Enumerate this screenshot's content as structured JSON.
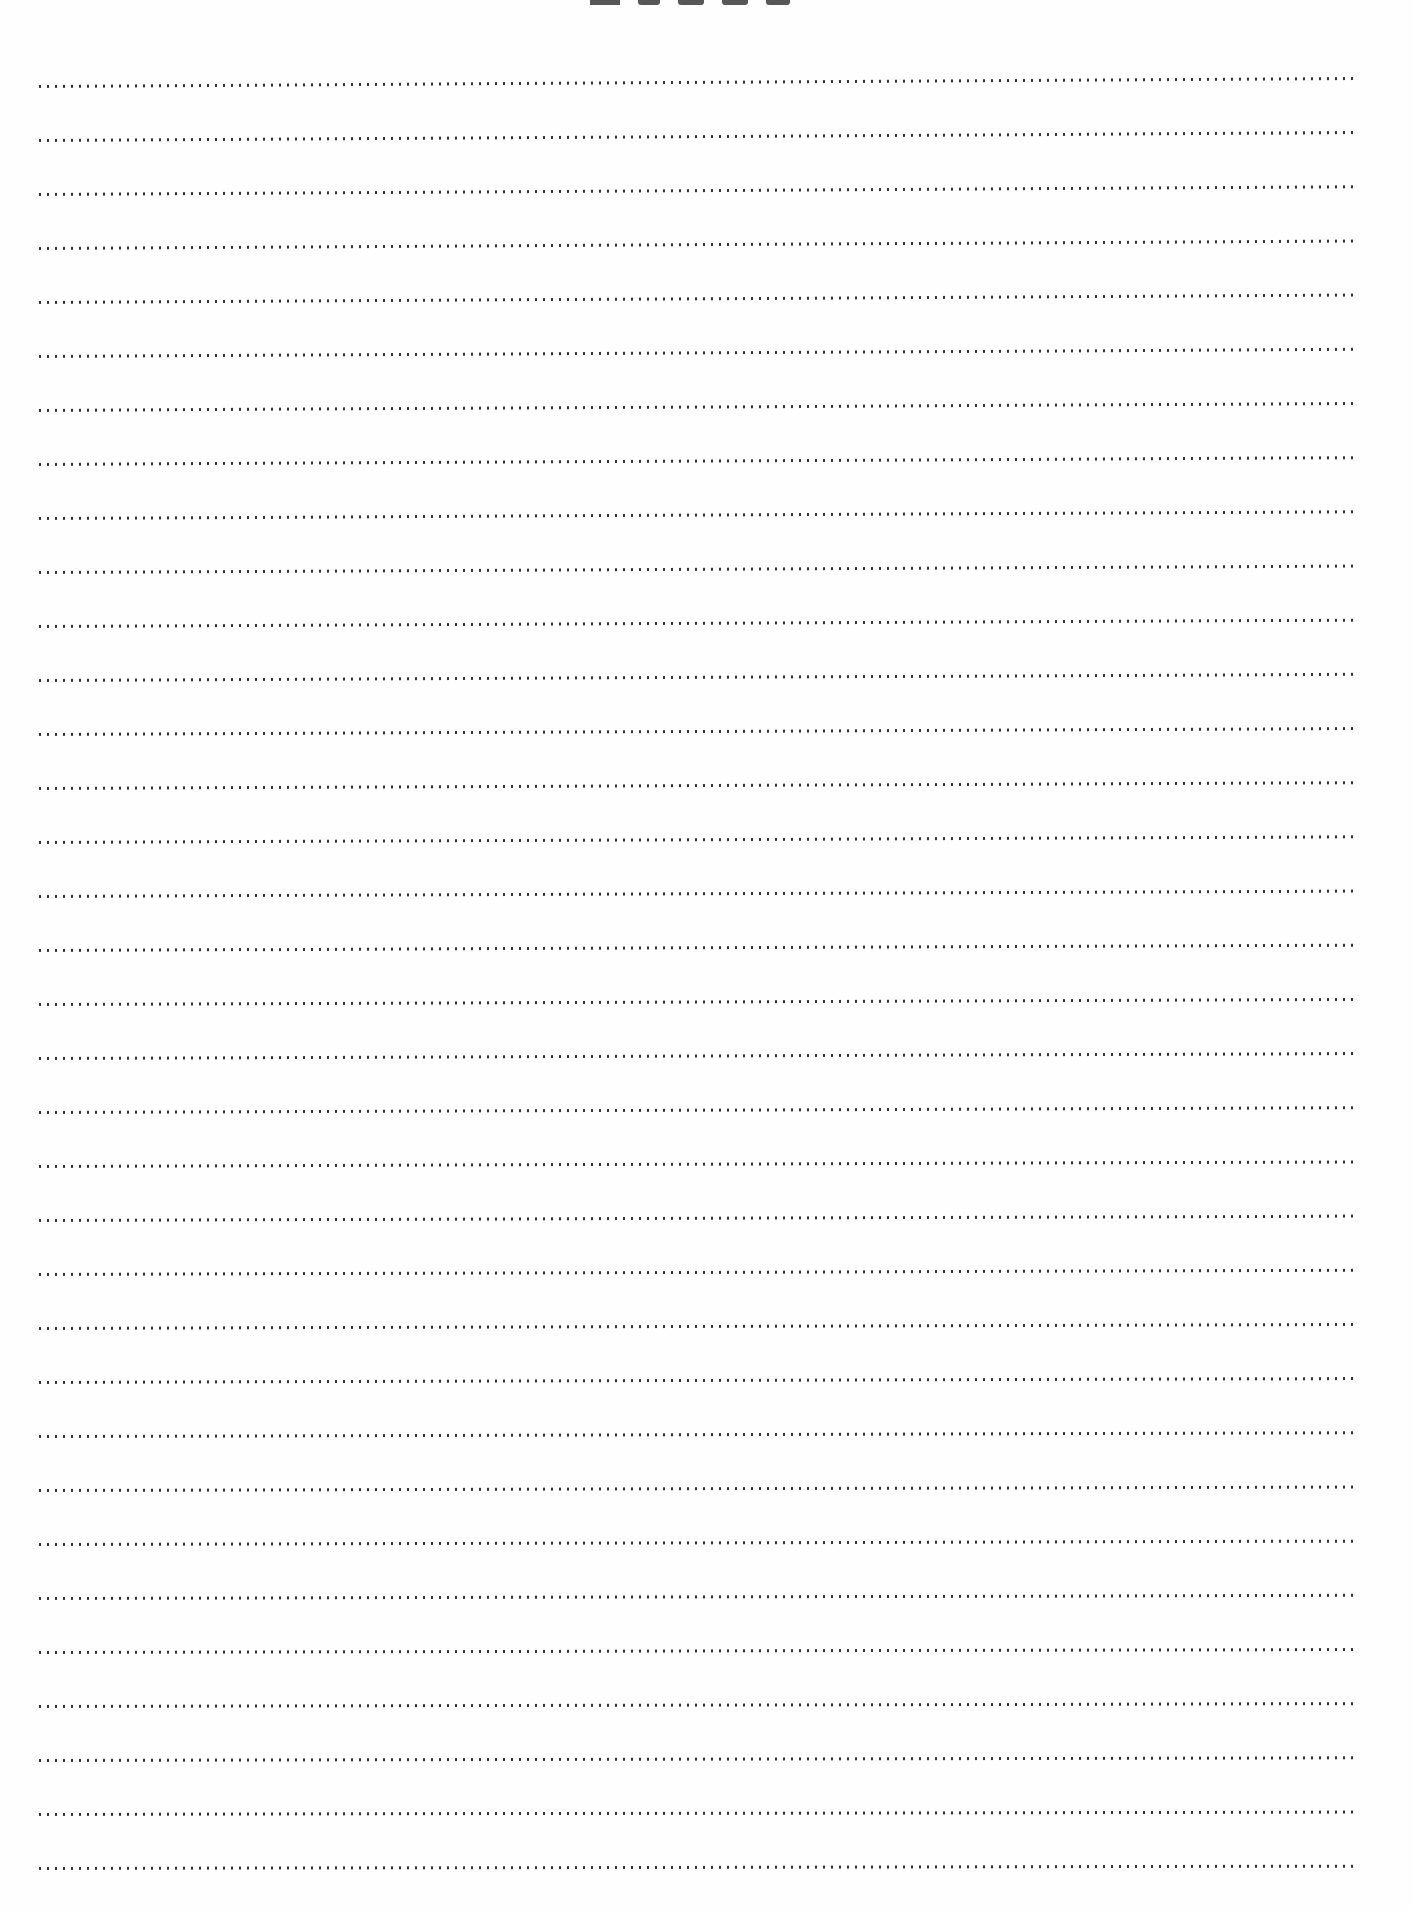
{
  "page": {
    "type": "lined-notes-page",
    "background_color": "#fefefe",
    "title": {
      "visible_text": "",
      "note": "title text cropped at top edge; only bottoms of 5 glyphs visible",
      "glyph_count": 5,
      "color": "#3a3a3a"
    },
    "ruled_lines": {
      "count": 34,
      "style": "dotted",
      "dot_color": "#2b2b2b",
      "dot_spacing_px": 8,
      "first_line_y": 86,
      "last_line_y": 1869,
      "line_spacing_px": 54.03,
      "left_x": 36,
      "right_x": 1358
    }
  }
}
